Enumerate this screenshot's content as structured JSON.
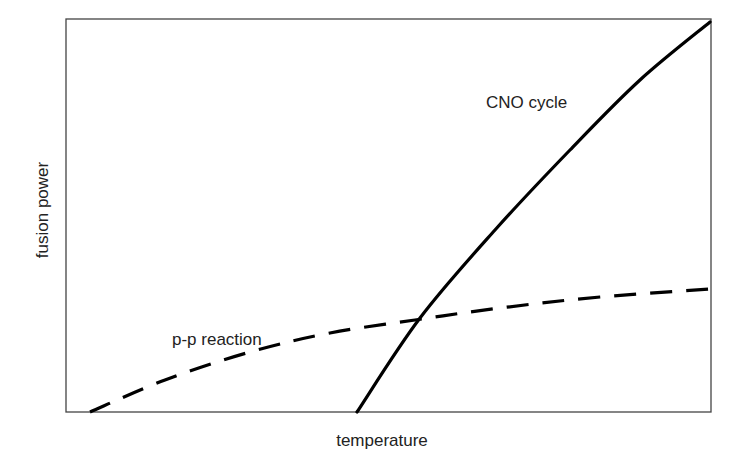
{
  "chart_data": {
    "type": "line",
    "title": "",
    "xlabel": "temperature",
    "ylabel": "fusion power",
    "grid": false,
    "legend": "none (inline curve labels)",
    "axis_ticks": "none",
    "plot_box_px": {
      "left": 66,
      "top": 19,
      "right": 711,
      "bottom": 412
    },
    "series": [
      {
        "name": "CNO cycle",
        "style": "solid",
        "color": "#000000",
        "points_px": [
          [
            357,
            412
          ],
          [
            420,
            318
          ],
          [
            495,
            230
          ],
          [
            570,
            150
          ],
          [
            640,
            80
          ],
          [
            710,
            22
          ]
        ]
      },
      {
        "name": "p-p reaction",
        "style": "dashed",
        "color": "#000000",
        "points_px": [
          [
            90,
            412
          ],
          [
            165,
            380
          ],
          [
            250,
            352
          ],
          [
            330,
            333
          ],
          [
            415,
            320
          ],
          [
            500,
            308
          ],
          [
            600,
            297
          ],
          [
            711,
            289
          ]
        ]
      }
    ],
    "annotations": [
      {
        "text": "CNO cycle",
        "x": 486,
        "y": 102
      },
      {
        "text": "p-p reaction",
        "x": 172,
        "y": 343
      }
    ]
  },
  "labels": {
    "x_axis": "temperature",
    "y_axis": "fusion power",
    "cno": "CNO cycle",
    "pp": "p-p reaction"
  }
}
